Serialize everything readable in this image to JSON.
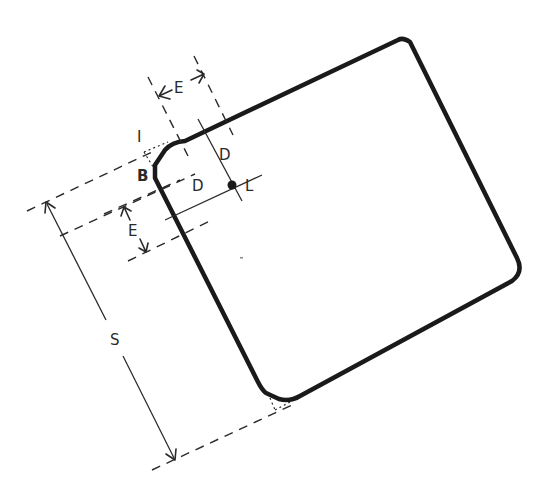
{
  "diagram": {
    "colors": {
      "ink": "#1a1a1a",
      "background": "#ffffff"
    },
    "labels": {
      "edge_length": "E",
      "edge_length_side": "E",
      "chamfer_offset": "D",
      "chamfer_offset_2": "D",
      "reference_point": "L",
      "chamfer": "B",
      "insert_corner": "I",
      "size": "S"
    }
  }
}
